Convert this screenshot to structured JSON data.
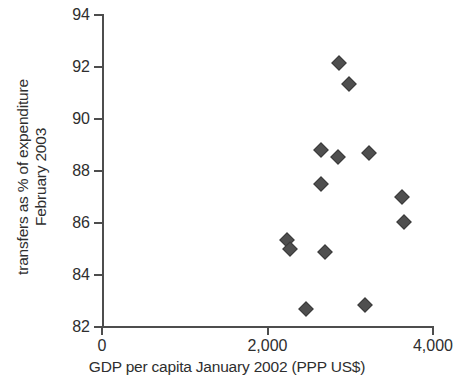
{
  "chart_data": {
    "type": "scatter",
    "title": "",
    "xlabel": "GDP per capita January 2002 (PPP US$)",
    "ylabel": "transfers as % of expenditure February 2003",
    "ylabel_lines": [
      "transfers as % of expenditure",
      "February 2003"
    ],
    "xlim": [
      0,
      4000
    ],
    "ylim": [
      82,
      94
    ],
    "xticks": [
      0,
      2000,
      4000
    ],
    "xticklabels": [
      "0",
      "2,000",
      "4,000"
    ],
    "yticks": [
      82,
      84,
      86,
      88,
      90,
      92,
      94
    ],
    "yticklabels": [
      "82",
      "84",
      "86",
      "88",
      "90",
      "92",
      "94"
    ],
    "grid": false,
    "legend": null,
    "marker_shape": "diamond",
    "marker_color": "#4f4f4f",
    "axis_color": "#4d4d4d",
    "points": [
      {
        "x": 2860,
        "y": 92.15
      },
      {
        "x": 2990,
        "y": 91.35
      },
      {
        "x": 2650,
        "y": 88.8
      },
      {
        "x": 2850,
        "y": 88.55
      },
      {
        "x": 3230,
        "y": 88.7
      },
      {
        "x": 2650,
        "y": 87.5
      },
      {
        "x": 3620,
        "y": 87.0
      },
      {
        "x": 3650,
        "y": 86.05
      },
      {
        "x": 2240,
        "y": 85.35
      },
      {
        "x": 2270,
        "y": 85.0
      },
      {
        "x": 2690,
        "y": 84.9
      },
      {
        "x": 2470,
        "y": 82.7
      },
      {
        "x": 3180,
        "y": 82.85
      }
    ]
  }
}
